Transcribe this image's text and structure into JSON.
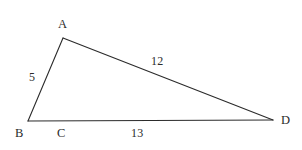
{
  "figure": {
    "type": "geometry-diagram",
    "shape": "triangle",
    "background_color": "#ffffff",
    "stroke_color": "#2b2b2b",
    "text_color": "#2b2b2b",
    "stroke_width": 1.1
  },
  "vertices": [
    {
      "name": "A",
      "label": "A",
      "x": 63,
      "y": 38,
      "label_x": 58,
      "label_y": 18
    },
    {
      "name": "B",
      "label": "B",
      "x": 28,
      "y": 121,
      "label_x": 15,
      "label_y": 127
    },
    {
      "name": "D",
      "label": "D",
      "x": 273,
      "y": 120,
      "label_x": 281,
      "label_y": 114
    }
  ],
  "point_labels": [
    {
      "name": "C",
      "label": "C",
      "label_x": 57,
      "label_y": 127
    }
  ],
  "edges": [
    {
      "name": "AB",
      "from": "A",
      "to": "B",
      "length_label": "5",
      "label_x": 29,
      "label_y": 71
    },
    {
      "name": "AD",
      "from": "A",
      "to": "D",
      "length_label": "12",
      "label_x": 151,
      "label_y": 55
    },
    {
      "name": "BD",
      "from": "B",
      "to": "D",
      "length_label": "13",
      "label_x": 131,
      "label_y": 127
    }
  ],
  "chart_data": {
    "type": "diagram",
    "title": "",
    "labels": [
      "A",
      "B",
      "C",
      "D"
    ],
    "side_lengths": {
      "AB": 5,
      "AD": 12,
      "BD": 13
    }
  }
}
